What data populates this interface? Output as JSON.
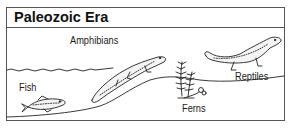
{
  "panel": {
    "title": "Paleozoic Era"
  },
  "labels": {
    "amphibians": "Amphibians",
    "fish": "Fish",
    "ferns": "Ferns",
    "reptiles": "Reptiles"
  },
  "colors": {
    "border": "#555555",
    "ink": "#1a1a1a",
    "background": "#ffffff"
  }
}
